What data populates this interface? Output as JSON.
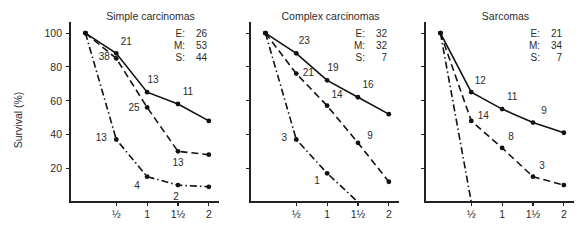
{
  "chart_data": [
    {
      "type": "line",
      "title": "Simple carcinomas",
      "xlabel": "",
      "ylabel": "Survival (%)",
      "x": [
        0,
        0.5,
        1,
        1.5,
        2
      ],
      "xtick_labels": [
        "½",
        "1",
        "1½",
        "2"
      ],
      "xticks": [
        0.5,
        1,
        1.5,
        2
      ],
      "yticks": [
        20,
        40,
        60,
        80,
        100
      ],
      "ytick_labels": [
        "20",
        "40",
        "60",
        "80",
        "100"
      ],
      "xlim": [
        -0.25,
        2.1
      ],
      "ylim": [
        0,
        103
      ],
      "grid": false,
      "legend_position": "top-right",
      "legend": [
        {
          "key": "E:",
          "value": "26"
        },
        {
          "key": "M:",
          "value": "53"
        },
        {
          "key": "S:",
          "value": "44"
        }
      ],
      "series": [
        {
          "name": "E",
          "style": "solid",
          "values": [
            100,
            88,
            65,
            58,
            48
          ],
          "point_labels": [
            "",
            "21",
            "13",
            "11",
            ""
          ],
          "label_offsets": [
            [
              0,
              0
            ],
            [
              10,
              -8
            ],
            [
              6,
              -9
            ],
            [
              10,
              -9
            ],
            [
              0,
              0
            ]
          ]
        },
        {
          "name": "M",
          "style": "dashed",
          "values": [
            100,
            85,
            56,
            30,
            28
          ],
          "point_labels": [
            "",
            "38",
            "25",
            "13",
            ""
          ],
          "label_offsets": [
            [
              0,
              0
            ],
            [
              -12,
              2
            ],
            [
              -13,
              4
            ],
            [
              0,
              15
            ],
            [
              0,
              0
            ]
          ]
        },
        {
          "name": "S",
          "style": "dashdot",
          "values": [
            100,
            37,
            15,
            10,
            9
          ],
          "point_labels": [
            "",
            "13",
            "4",
            "2",
            ""
          ],
          "label_offsets": [
            [
              0,
              0
            ],
            [
              -15,
              2
            ],
            [
              -10,
              12
            ],
            [
              -2,
              15
            ],
            [
              0,
              0
            ]
          ]
        }
      ]
    },
    {
      "type": "line",
      "title": "Complex carcinomas",
      "xlabel": "",
      "ylabel": "",
      "x": [
        0,
        0.5,
        1,
        1.5,
        2
      ],
      "xtick_labels": [
        "½",
        "1",
        "1½",
        "2"
      ],
      "xticks": [
        0.5,
        1,
        1.5,
        2
      ],
      "yticks": [
        20,
        40,
        60,
        80,
        100
      ],
      "ytick_labels": [
        "",
        "",
        "",
        "",
        ""
      ],
      "xlim": [
        -0.25,
        2.1
      ],
      "ylim": [
        0,
        103
      ],
      "grid": false,
      "legend_position": "top-right",
      "legend": [
        {
          "key": "E:",
          "value": "32"
        },
        {
          "key": "M:",
          "value": "32"
        },
        {
          "key": "S:",
          "value": "7"
        }
      ],
      "series": [
        {
          "name": "E",
          "style": "solid",
          "values": [
            100,
            88,
            72,
            62,
            52
          ],
          "point_labels": [
            "",
            "23",
            "19",
            "16",
            ""
          ],
          "label_offsets": [
            [
              0,
              0
            ],
            [
              8,
              -9
            ],
            [
              6,
              -9
            ],
            [
              10,
              -9
            ],
            [
              0,
              0
            ]
          ]
        },
        {
          "name": "M",
          "style": "dashed",
          "values": [
            100,
            76,
            57,
            35,
            12
          ],
          "point_labels": [
            "",
            "21",
            "14",
            "9",
            ""
          ],
          "label_offsets": [
            [
              0,
              0
            ],
            [
              12,
              2
            ],
            [
              10,
              -8
            ],
            [
              12,
              -4
            ],
            [
              0,
              0
            ]
          ]
        },
        {
          "name": "S",
          "style": "dashdot",
          "values": [
            100,
            37,
            17,
            0,
            null
          ],
          "point_labels": [
            "",
            "3",
            "1",
            "",
            ""
          ],
          "label_offsets": [
            [
              0,
              0
            ],
            [
              -12,
              2
            ],
            [
              -10,
              11
            ],
            [
              0,
              0
            ],
            [
              0,
              0
            ]
          ]
        }
      ]
    },
    {
      "type": "line",
      "title": "Sarcomas",
      "xlabel": "",
      "ylabel": "",
      "x": [
        0,
        0.5,
        1,
        1.5,
        2
      ],
      "xtick_labels": [
        "½",
        "1",
        "1½",
        "2"
      ],
      "xticks": [
        0.5,
        1,
        1.5,
        2
      ],
      "yticks": [
        20,
        40,
        60,
        80,
        100
      ],
      "ytick_labels": [
        "",
        "",
        "",
        "",
        ""
      ],
      "xlim": [
        -0.25,
        2.1
      ],
      "ylim": [
        0,
        103
      ],
      "grid": false,
      "legend_position": "top-right",
      "legend": [
        {
          "key": "E:",
          "value": "21"
        },
        {
          "key": "M:",
          "value": "34"
        },
        {
          "key": "S:",
          "value": "7"
        }
      ],
      "series": [
        {
          "name": "E",
          "style": "solid",
          "values": [
            100,
            65,
            55,
            47,
            41
          ],
          "point_labels": [
            "",
            "12",
            "11",
            "9",
            ""
          ],
          "label_offsets": [
            [
              0,
              0
            ],
            [
              9,
              -8
            ],
            [
              10,
              -9
            ],
            [
              11,
              -9
            ],
            [
              0,
              0
            ]
          ]
        },
        {
          "name": "M",
          "style": "dashed",
          "values": [
            100,
            48,
            32,
            15,
            10
          ],
          "point_labels": [
            "",
            "14",
            "8",
            "3",
            ""
          ],
          "label_offsets": [
            [
              0,
              0
            ],
            [
              12,
              -2
            ],
            [
              9,
              -8
            ],
            [
              9,
              -8
            ],
            [
              0,
              0
            ]
          ]
        },
        {
          "name": "S",
          "style": "dashdot",
          "values": [
            100,
            0,
            null,
            null,
            null
          ],
          "point_labels": [
            "",
            "",
            "",
            "",
            ""
          ],
          "label_offsets": [
            [
              0,
              0
            ],
            [
              0,
              0
            ],
            [
              0,
              0
            ],
            [
              0,
              0
            ],
            [
              0,
              0
            ]
          ]
        }
      ]
    }
  ],
  "axis": {
    "ylabel": "Survival (%)"
  },
  "colors": {
    "ink": "#111111",
    "text": "#2b2b2b",
    "background": "#ffffff"
  }
}
